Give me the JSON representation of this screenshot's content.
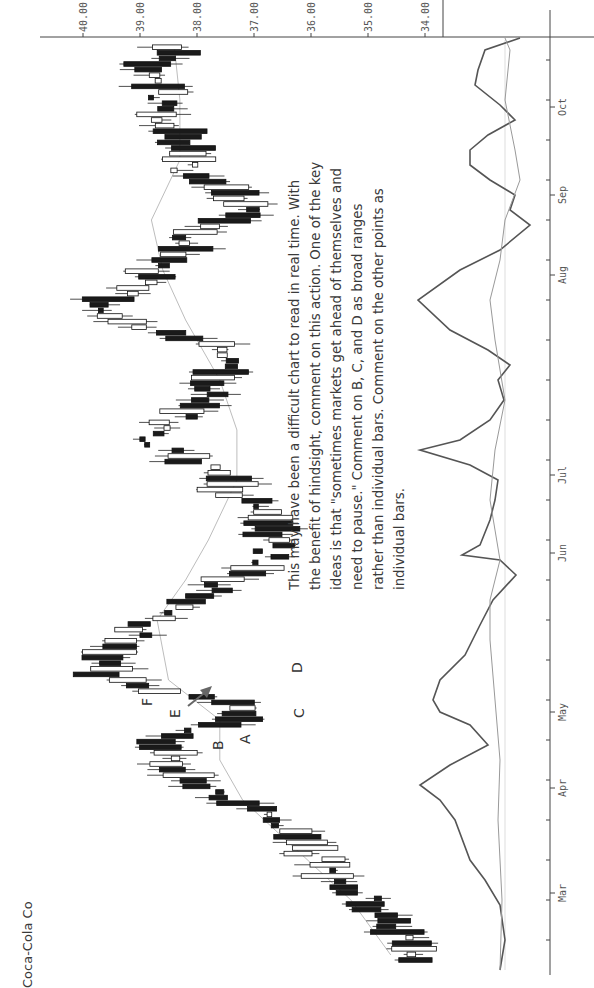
{
  "title": "Coca-Cola Co",
  "annotation": "This may have been a difficult chart to read in real time. With the benefit of hindsight, comment on this action. One of the key ideas is that \"sometimes markets get ahead of themselves and need to pause.\" Comment on B, C, and D as broad ranges rather than individual bars. Comment on the other points as individual bars.",
  "labels": [
    {
      "text": "A",
      "date_y": 732,
      "price": 39.1
    },
    {
      "text": "B",
      "date_y": 752,
      "price": 38.4
    },
    {
      "text": "C",
      "date_y": 718,
      "price": 36.5
    },
    {
      "text": "D",
      "date_y": 675,
      "price": 36.7
    },
    {
      "text": "E",
      "date_y": 722,
      "price": 39.9
    },
    {
      "text": "F",
      "date_y": 690,
      "price": 40.5
    }
  ],
  "colors": {
    "axis": "#444444",
    "candle_fill_down": "#1a1a1a",
    "candle_fill_up": "#ffffff",
    "ma": "#bdbdbd",
    "osc_main": "#555555",
    "osc_signal": "#999999",
    "text": "#3a3a3a"
  },
  "chart_data": {
    "type": "candlestick",
    "title": "Coca-Cola Co",
    "orientation": "rotated 90° counter-clockwise (time runs bottom→top, price increases right→left)",
    "price_axis": {
      "ticks": [
        "40.00",
        "39.00",
        "38.00",
        "37.00",
        "36.00",
        "35.00",
        "34.00"
      ],
      "range": [
        33.7,
        40.5
      ]
    },
    "time_axis": {
      "ticks": [
        "Mar",
        "Apr",
        "May",
        "Jun",
        "Jul",
        "Aug",
        "Sep",
        "Oct"
      ]
    },
    "series": [
      {
        "name": "Price (daily candles)",
        "approx_closes_by_month": {
          "Mar_start": 34.2,
          "Apr": 38.5,
          "May": 39.7,
          "Jun": 36.6,
          "Jul": 38.6,
          "Aug": 39.4,
          "Sep": 37.3,
          "Oct": 38.5,
          "Oct_end": 38.7
        }
      },
      {
        "name": "Moving average",
        "approx": {
          "Mar": 34.6,
          "Apr": 37.6,
          "May": 38.6,
          "Jun": 37.5,
          "Jul": 37.2,
          "Aug": 38.3,
          "Sep": 38.5,
          "Oct": 38.3
        }
      },
      {
        "name": "Oscillator (lower panel)",
        "note": "momentum line with slower signal line"
      }
    ],
    "annotations": [
      "A",
      "B",
      "C",
      "D",
      "E",
      "F",
      "arrow pointing to E"
    ]
  }
}
